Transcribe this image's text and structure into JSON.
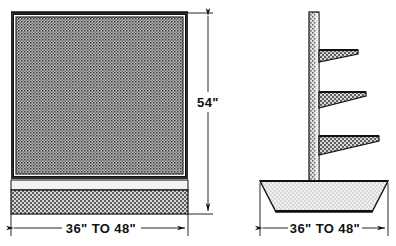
{
  "drawing": {
    "title": "Pegboard display fixture — front and side elevation",
    "background_color": "#ffffff",
    "line_color": "#111111",
    "views": [
      {
        "name": "front-view",
        "label": "Front elevation",
        "parts": [
          {
            "name": "pegboard-panel",
            "description": "Perforated pegboard panel with dark frame",
            "fill_color": "#8d8d8d"
          },
          {
            "name": "panel-frame",
            "description": "Dark outer frame of pegboard panel",
            "fill_color": "#2b2b2b"
          },
          {
            "name": "base-gap-band",
            "description": "Light recessed band below panel",
            "fill_color": "#f2f2f2"
          },
          {
            "name": "base-kick-panel",
            "description": "Stippled base kick panel",
            "fill_color": "#9a9a9a"
          }
        ]
      },
      {
        "name": "side-view",
        "label": "Side elevation",
        "parts": [
          {
            "name": "vertical-post",
            "description": "Upright stippled post",
            "fill_color": "#9a9a9a"
          },
          {
            "name": "shelf-upper",
            "description": "Upper wedge shelf",
            "fill_color": "#9a9a9a"
          },
          {
            "name": "shelf-middle",
            "description": "Middle wedge shelf",
            "fill_color": "#9a9a9a"
          },
          {
            "name": "shelf-lower",
            "description": "Lower wedge shelf",
            "fill_color": "#9a9a9a"
          },
          {
            "name": "trapezoid-base",
            "description": "Tapered pedestal base",
            "fill_color": "#e6e6e6"
          }
        ]
      }
    ]
  },
  "dimensions": {
    "height": {
      "label": "54\"",
      "value": 54,
      "unit": "inches",
      "orientation": "vertical",
      "applies_to": "front-view"
    },
    "front_width": {
      "label": "36\" TO 48\"",
      "min": 36,
      "max": 48,
      "unit": "inches",
      "orientation": "horizontal",
      "applies_to": "front-view"
    },
    "side_width": {
      "label": "36\" TO 48\"",
      "min": 36,
      "max": 48,
      "unit": "inches",
      "orientation": "horizontal",
      "applies_to": "side-view"
    }
  }
}
